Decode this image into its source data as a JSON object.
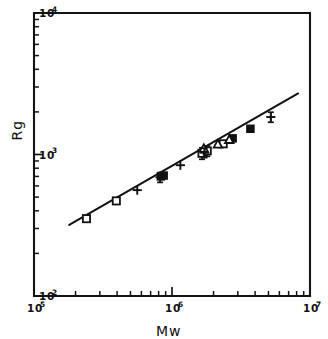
{
  "chart_data": {
    "type": "scatter",
    "title": "",
    "xlabel": "Mw",
    "ylabel": "Rg",
    "xscale": "log",
    "yscale": "log",
    "xlim": [
      100000,
      10000000
    ],
    "ylim": [
      100,
      10000
    ],
    "grid": false,
    "legend": "none",
    "xticklabels": [
      "10^5",
      "10^6",
      "10^7"
    ],
    "yticklabels": [
      "10^2",
      "10^3",
      "10^4"
    ],
    "xtick_base": "10",
    "xtick_exponents": [
      "5",
      "6",
      "7"
    ],
    "ytick_base": "10",
    "ytick_exponents": [
      "2",
      "3",
      "4"
    ],
    "fit": {
      "type": "power-law",
      "label": "",
      "slope": 0.58,
      "x_start": 180000,
      "x_end": 8200000,
      "y_start": 318,
      "y_end": 2700
    },
    "series": [
      {
        "name": "open-square",
        "marker": "open-square",
        "points": [
          {
            "x": 240000,
            "y": 352,
            "yerr": 0
          },
          {
            "x": 395000,
            "y": 470,
            "yerr": 0
          },
          {
            "x": 1650000,
            "y": 1020,
            "yerr": 95
          },
          {
            "x": 1800000,
            "y": 1060,
            "yerr": 90
          },
          {
            "x": 2350000,
            "y": 1190,
            "yerr": 0
          }
        ]
      },
      {
        "name": "filled-square",
        "marker": "filled-square",
        "points": [
          {
            "x": 830000,
            "y": 700,
            "yerr": 0
          },
          {
            "x": 870000,
            "y": 710,
            "yerr": 0
          },
          {
            "x": 2750000,
            "y": 1300,
            "yerr": 0
          },
          {
            "x": 3700000,
            "y": 1520,
            "yerr": 0
          }
        ]
      },
      {
        "name": "triangle",
        "marker": "triangle",
        "points": [
          {
            "x": 1700000,
            "y": 1100,
            "yerr": 0
          },
          {
            "x": 2150000,
            "y": 1180,
            "yerr": 0
          },
          {
            "x": 2600000,
            "y": 1270,
            "yerr": 0
          }
        ]
      },
      {
        "name": "cross",
        "marker": "cross",
        "points": [
          {
            "x": 560000,
            "y": 560,
            "yerr": 0
          },
          {
            "x": 820000,
            "y": 690,
            "yerr": 55
          },
          {
            "x": 1150000,
            "y": 840,
            "yerr": 0
          },
          {
            "x": 1720000,
            "y": 1030,
            "yerr": 80
          },
          {
            "x": 5200000,
            "y": 1840,
            "yerr": 150
          }
        ]
      }
    ]
  },
  "axes": {
    "x_title": "Mw",
    "y_title": "Rg"
  }
}
